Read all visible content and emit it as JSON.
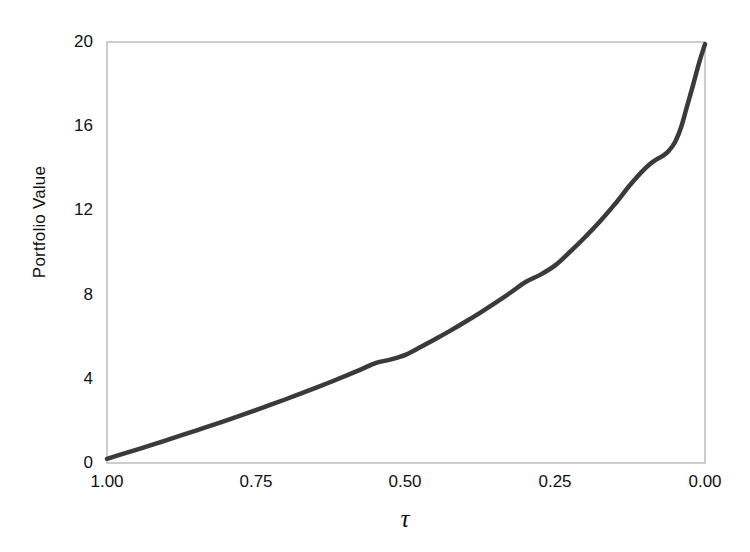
{
  "chart_data": {
    "type": "line",
    "title": "",
    "xlabel": "τ",
    "ylabel": "Portfolio Value",
    "xlim": [
      1.0,
      0.0
    ],
    "ylim": [
      0,
      20
    ],
    "x_ticks": [
      "1.00",
      "0.75",
      "0.50",
      "0.25",
      "0.00"
    ],
    "x_tick_values": [
      1.0,
      0.75,
      0.5,
      0.25,
      0.0
    ],
    "y_ticks": [
      "0",
      "4",
      "8",
      "12",
      "16",
      "20"
    ],
    "y_tick_values": [
      0,
      4,
      8,
      12,
      16,
      20
    ],
    "x_axis_reversed": true,
    "grid": false,
    "legend": null,
    "series": [
      {
        "name": "Portfolio Value",
        "color": "#3a3a3a",
        "line_width": 4.5,
        "x": [
          1.0,
          0.975,
          0.95,
          0.925,
          0.9,
          0.875,
          0.85,
          0.825,
          0.8,
          0.775,
          0.75,
          0.725,
          0.7,
          0.675,
          0.65,
          0.625,
          0.6,
          0.575,
          0.55,
          0.525,
          0.5,
          0.475,
          0.45,
          0.425,
          0.4,
          0.375,
          0.35,
          0.325,
          0.3,
          0.275,
          0.25,
          0.225,
          0.2,
          0.175,
          0.15,
          0.125,
          0.1,
          0.085,
          0.07,
          0.06,
          0.05,
          0.04,
          0.03,
          0.02,
          0.01,
          0.0
        ],
        "y": [
          0.2,
          0.42,
          0.64,
          0.86,
          1.09,
          1.32,
          1.55,
          1.79,
          2.03,
          2.27,
          2.52,
          2.78,
          3.04,
          3.31,
          3.58,
          3.86,
          4.15,
          4.45,
          4.76,
          4.92,
          5.15,
          5.52,
          5.9,
          6.3,
          6.72,
          7.16,
          7.62,
          8.1,
          8.6,
          8.95,
          9.4,
          10.05,
          10.75,
          11.5,
          12.32,
          13.22,
          14.0,
          14.35,
          14.6,
          14.85,
          15.25,
          15.95,
          16.95,
          17.95,
          19.0,
          19.9
        ]
      }
    ],
    "annotations": []
  },
  "figure": {
    "background_color": "#ffffff",
    "axes_frame_color": "#b8b8b8",
    "tick_label_color": "#111111"
  }
}
